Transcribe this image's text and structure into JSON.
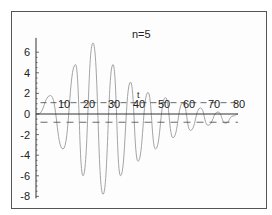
{
  "chart_data": {
    "type": "line",
    "title": "n=5",
    "xlabel": "",
    "ylabel": "",
    "xlim": [
      0,
      80
    ],
    "ylim": [
      -8,
      7
    ],
    "x_ticks": [
      10,
      20,
      30,
      40,
      50,
      60,
      70,
      80
    ],
    "y_ticks": [
      6,
      4,
      2,
      0,
      -2,
      -4,
      -6,
      -8
    ],
    "grid": false,
    "legend": null,
    "reference_lines": [
      {
        "orientation": "horizontal",
        "y": 1.1,
        "style": "dashed"
      },
      {
        "orientation": "horizontal",
        "y": -0.8,
        "style": "dashed"
      }
    ],
    "annotations": [
      {
        "text": "t",
        "x": 40,
        "y": 1.5
      }
    ],
    "series": [
      {
        "name": "damped oscillation",
        "description": "Oscillating signal with envelope growing to a maximum near x≈22 then decaying toward 0 by x≈80",
        "peaks": [
          {
            "x": 5,
            "y": 1.8
          },
          {
            "x": 15,
            "y": 4.8
          },
          {
            "x": 22,
            "y": 6.9
          },
          {
            "x": 30,
            "y": 4.8
          },
          {
            "x": 37,
            "y": 3.1
          },
          {
            "x": 44,
            "y": 2.1
          },
          {
            "x": 51,
            "y": 1.6
          },
          {
            "x": 58,
            "y": 1.1
          },
          {
            "x": 65,
            "y": 0.6
          },
          {
            "x": 72,
            "y": 0.2
          },
          {
            "x": 78,
            "y": -0.2
          }
        ],
        "troughs": [
          {
            "x": 10,
            "y": -3.4
          },
          {
            "x": 18,
            "y": -6.0
          },
          {
            "x": 26,
            "y": -7.8
          },
          {
            "x": 33,
            "y": -6.0
          },
          {
            "x": 40,
            "y": -4.6
          },
          {
            "x": 47,
            "y": -3.4
          },
          {
            "x": 54,
            "y": -2.3
          },
          {
            "x": 61,
            "y": -1.6
          },
          {
            "x": 68,
            "y": -1.1
          },
          {
            "x": 75,
            "y": -0.9
          }
        ]
      }
    ]
  },
  "labels": {
    "title": "n=5",
    "annotation": "t",
    "x_ticks": [
      "10",
      "20",
      "30",
      "40",
      "50",
      "60",
      "70",
      "80"
    ],
    "y_ticks": [
      "6",
      "4",
      "2",
      "0",
      "-2",
      "-4",
      "-6",
      "-8"
    ]
  },
  "colors": {
    "frame": "#555555",
    "axis": "#333333",
    "curve": "#9a9a9a",
    "reference": "#444444",
    "text": "#222222"
  }
}
